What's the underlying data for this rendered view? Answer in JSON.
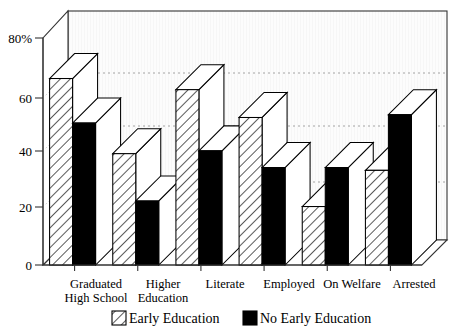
{
  "chart_data": {
    "type": "bar",
    "title": "",
    "subtitle": "",
    "xlabel": "",
    "ylabel": "",
    "categories": [
      "Graduated High School",
      "Higher Education",
      "Literate",
      "Employed",
      "On Welfare",
      "Arrested"
    ],
    "category_lines": [
      [
        "Graduated",
        "High School"
      ],
      [
        "Higher",
        "Education"
      ],
      [
        "Literate",
        ""
      ],
      [
        "Employed",
        ""
      ],
      [
        "On Welfare",
        ""
      ],
      [
        "Arrested",
        ""
      ]
    ],
    "series": [
      {
        "name": "Early Education",
        "fill": "diagonal-hatch",
        "color": "#ffffff",
        "values": [
          67,
          40,
          63,
          53,
          21,
          34
        ]
      },
      {
        "name": "No Early Education",
        "fill": "solid",
        "color": "#000000",
        "values": [
          51,
          23,
          41,
          35,
          35,
          54
        ]
      }
    ],
    "yticks": [
      0,
      20,
      40,
      60,
      80
    ],
    "ytick_labels": [
      "0",
      "20",
      "40",
      "60",
      "80%"
    ],
    "ylim": [
      0,
      85
    ],
    "gridlines": [
      20,
      40,
      60
    ],
    "grid": true,
    "legend_position": "bottom",
    "style": "3d-bar",
    "axis_unit": "%"
  },
  "axis": {
    "y_tick_0": "0",
    "y_tick_1": "20",
    "y_tick_2": "40",
    "y_tick_3": "60",
    "y_tick_4": "80%"
  },
  "categories": {
    "c0_line1": "Graduated",
    "c0_line2": "High School",
    "c1_line1": "Higher",
    "c1_line2": "Education",
    "c2_line1": "Literate",
    "c3_line1": "Employed",
    "c4_line1": "On Welfare",
    "c5_line1": "Arrested"
  },
  "legend": {
    "item1_label": "Early Education",
    "item2_label": "No Early Education"
  },
  "colors": {
    "background": "#ffffff",
    "plot_back_wall": "#fbfbfb",
    "bar_hatch_bg": "#ffffff",
    "bar_solid": "#000000",
    "bar_top_face": "#ffffff",
    "bar_side_face": "#ffffff",
    "outline": "#000000",
    "gridline": "#9a9a9a"
  }
}
